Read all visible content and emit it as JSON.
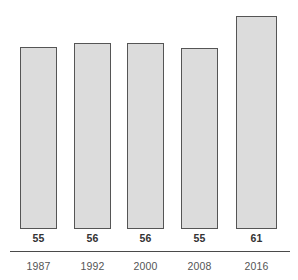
{
  "chart_data": {
    "type": "bar",
    "title": "",
    "subtitle": "",
    "xlabel": "",
    "ylabel": "",
    "categories": [
      "1987",
      "1992",
      "2000",
      "2008",
      "2016"
    ],
    "values": [
      55,
      56,
      56,
      55,
      61
    ],
    "value_labels": [
      "55",
      "56",
      "56",
      "55",
      "61"
    ],
    "ylim": [
      0,
      72
    ],
    "grid": false,
    "legend": null,
    "legend_position": "none",
    "annotations": [],
    "colors": {
      "background": "#ffffff",
      "bar_fill": "#dcdcdc",
      "bar_border": "#555555",
      "axis_line": "#4a4a4a",
      "value_text": "#333333",
      "category_text": "#555555"
    },
    "bar_geometry": [
      {
        "x": 20,
        "width": 37,
        "top": 46
      },
      {
        "x": 74,
        "width": 37,
        "top": 42
      },
      {
        "x": 127,
        "width": 37,
        "top": 42
      },
      {
        "x": 181,
        "width": 37,
        "top": 47
      },
      {
        "x": 236,
        "width": 41,
        "top": 15
      }
    ],
    "baseline_y": 228
  }
}
